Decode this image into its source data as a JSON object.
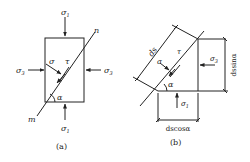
{
  "figure_a": {
    "caption": "(a)",
    "labels": {
      "sigma1_top": "σ",
      "sigma1_top_sub": "1",
      "sigma1_bottom": "σ",
      "sigma1_bottom_sub": "1",
      "sigma3_left": "σ",
      "sigma3_left_sub": "3",
      "sigma3_right": "σ",
      "sigma3_right_sub": "3",
      "sigma": "σ",
      "tau": "τ",
      "alpha": "α",
      "m": "m",
      "n": "n"
    }
  },
  "figure_b": {
    "caption": "(b)",
    "labels": {
      "ds": "ds",
      "sigma": "σ",
      "tau": "τ",
      "alpha": "α",
      "sigma3": "σ",
      "sigma3_sub": "3",
      "sigma1": "σ",
      "sigma1_sub": "1",
      "dssin": "dssinα",
      "dscos": "dscosα"
    }
  },
  "colors": {
    "stroke": "#222222",
    "background": "#ffffff"
  }
}
